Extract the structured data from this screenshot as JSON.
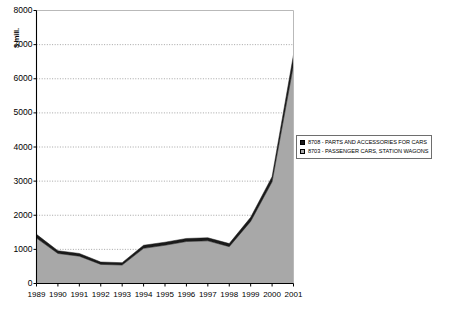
{
  "chart_data": {
    "type": "area",
    "stacked": true,
    "title": "",
    "subtitle": "",
    "xlabel": "",
    "ylabel": "$ mill.",
    "categories": [
      "1989",
      "1990",
      "1991",
      "1992",
      "1993",
      "1994",
      "1995",
      "1996",
      "1997",
      "1998",
      "1999",
      "2000",
      "2001"
    ],
    "x": [
      1989,
      1990,
      1991,
      1992,
      1993,
      1994,
      1995,
      1996,
      1997,
      1998,
      1999,
      2000,
      2001
    ],
    "ylim": [
      0,
      8000
    ],
    "ytick_labels": [
      "0",
      "1000",
      "2000",
      "3000",
      "4000",
      "5000",
      "6000",
      "7000",
      "8000"
    ],
    "ytick_values": [
      0,
      1000,
      2000,
      3000,
      4000,
      5000,
      6000,
      7000,
      8000
    ],
    "grid": true,
    "grid_style": "dotted-horizontal",
    "legend_position": "right",
    "series": [
      {
        "name": "8703 - PASSENGER CARS, STATION WAGONS",
        "code": "8703",
        "color": "#a8a8a8",
        "values": [
          1330,
          880,
          800,
          560,
          540,
          1030,
          1120,
          1230,
          1250,
          1080,
          1820,
          2980,
          6400
        ]
      },
      {
        "name": "8708 - PARTS AND ACCESSORIES FOR CARS",
        "code": "8708",
        "color": "#1a1a1a",
        "values": [
          110,
          80,
          80,
          70,
          70,
          90,
          90,
          90,
          90,
          90,
          120,
          150,
          300
        ]
      }
    ],
    "totals": [
      1440,
      960,
      880,
      630,
      610,
      1120,
      1210,
      1320,
      1340,
      1170,
      1940,
      3130,
      6700
    ]
  },
  "legend": {
    "items": [
      {
        "marker": "filled-square-dark",
        "label": "8708 - PARTS AND ACCESSORIES FOR CARS",
        "color": "#1a1a1a"
      },
      {
        "marker": "filled-square-gray",
        "label": "8703 - PASSENGER CARS, STATION WAGONS",
        "color": "#a8a8a8"
      }
    ]
  },
  "axes": {
    "y_axis_title": "$ mill.",
    "y_ticks": [
      "8000",
      "7000",
      "6000",
      "5000",
      "4000",
      "3000",
      "2000",
      "1000",
      "0"
    ],
    "x_ticks": [
      "1989",
      "1990",
      "1991",
      "1992",
      "1993",
      "1994",
      "1995",
      "1996",
      "1997",
      "1998",
      "1999",
      "2000",
      "2001"
    ]
  },
  "colors": {
    "series_parts": "#1a1a1a",
    "series_cars": "#a8a8a8",
    "axis": "#000000",
    "grid": "#808080",
    "background": "#ffffff"
  }
}
